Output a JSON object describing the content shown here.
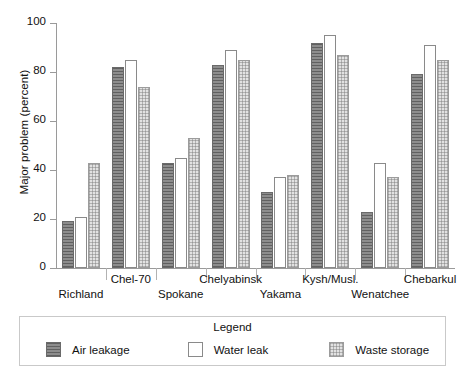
{
  "chart_data": {
    "type": "bar",
    "title": "",
    "xlabel": "",
    "ylabel": "Major problem (percent)",
    "ylim": [
      0,
      100
    ],
    "yticks": [
      0,
      20,
      40,
      60,
      80,
      100
    ],
    "ytick_labels": [
      "0",
      "20",
      "40",
      "60",
      "80",
      "100"
    ],
    "grid": false,
    "legend_position": "bottom",
    "legend_title": "Legend",
    "categories": [
      "Richland",
      "Chel-70",
      "Spokane",
      "Chelyabinsk",
      "Yakama",
      "Kysh/Musl.",
      "Wenatchee",
      "Chebarkul"
    ],
    "category_rows": [
      "bottom",
      "top",
      "bottom",
      "top",
      "bottom",
      "top",
      "bottom",
      "top"
    ],
    "series": [
      {
        "name": "Air leakage",
        "pattern": "dark-horizontal-hatch",
        "color": "#8d8d8d",
        "values": [
          19,
          82,
          43,
          83,
          31,
          92,
          23,
          79
        ]
      },
      {
        "name": "Water leak",
        "pattern": "open-white",
        "color": "#ffffff",
        "values": [
          21,
          85,
          45,
          89,
          37,
          95,
          43,
          91
        ]
      },
      {
        "name": "Waste storage",
        "pattern": "light-checker",
        "color": "#e2e2e2",
        "values": [
          43,
          74,
          53,
          85,
          38,
          87,
          37,
          85
        ]
      }
    ]
  },
  "legend": {
    "title": "Legend",
    "items": [
      {
        "label": "Air leakage"
      },
      {
        "label": "Water leak"
      },
      {
        "label": "Waste storage"
      }
    ]
  }
}
